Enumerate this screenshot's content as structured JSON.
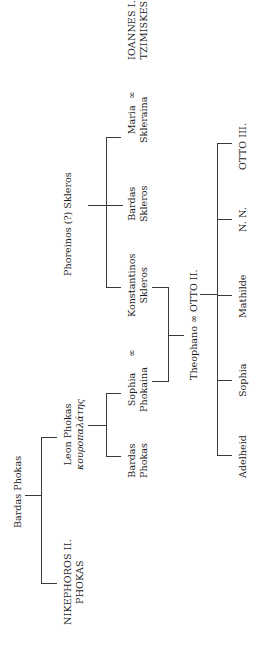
{
  "diagram": {
    "type": "genealogical-tree",
    "orientation": "rotated-90-ccw",
    "marriage_symbol": "∞",
    "people": {
      "bardas_phokas": {
        "line1": "Bardas Phokas"
      },
      "nikephoros": {
        "line1": "NIKEPHOROS II.",
        "line2": "PHOKAS"
      },
      "leon_phokas": {
        "line1": "Leon Phokas",
        "line2": "κουροπαλάτης"
      },
      "bardas_phokas_jr": {
        "line1": "Bardas",
        "line2": "Phokas"
      },
      "sophia_phokaina": {
        "line1": "Sophia",
        "line2": "Phokaina"
      },
      "phoreinos_skleros": {
        "line1": "Phoreinos (?) Skleros"
      },
      "konstantinos_skleros": {
        "line1": "Konstantinos",
        "line2": "Skleros"
      },
      "bardas_skleros": {
        "line1": "Bardas",
        "line2": "Skleros"
      },
      "maria_skleraina": {
        "line1": "Maria",
        "line2": "Skleraina"
      },
      "ioannes_tzimiskes": {
        "line1": "IOANNES I.",
        "line2": "TZIMISKES"
      },
      "theophano_otto": {
        "line1": "Theophano ∞ OTTO II."
      },
      "adelheid": {
        "line1": "Adelheid"
      },
      "sophia": {
        "line1": "Sophia"
      },
      "mathilde": {
        "line1": "Mathilde"
      },
      "nn": {
        "line1": "N. N."
      },
      "otto_iii": {
        "line1": "OTTO III."
      }
    },
    "marriages": [
      [
        "Sophia Phokaina",
        "Konstantinos Skleros"
      ],
      [
        "Maria Skleraina",
        "IOANNES I. TZIMISKES"
      ],
      [
        "Theophano",
        "OTTO II."
      ]
    ],
    "descent": [
      {
        "parent": "Bardas Phokas",
        "children": [
          "NIKEPHOROS II. PHOKAS",
          "Leon Phokas"
        ]
      },
      {
        "parent": "Leon Phokas",
        "children": [
          "Bardas Phokas",
          "Sophia Phokaina"
        ]
      },
      {
        "parent": "Phoreinos (?) Skleros",
        "children": [
          "Konstantinos Skleros",
          "Bardas Skleros",
          "Maria Skleraina"
        ]
      },
      {
        "parent": "Konstantinos Skleros ∞ Sophia Phokaina",
        "children": [
          "Theophano"
        ]
      },
      {
        "parent": "Theophano ∞ OTTO II.",
        "children": [
          "Adelheid",
          "Sophia",
          "Mathilde",
          "N. N.",
          "OTTO III."
        ]
      }
    ]
  }
}
